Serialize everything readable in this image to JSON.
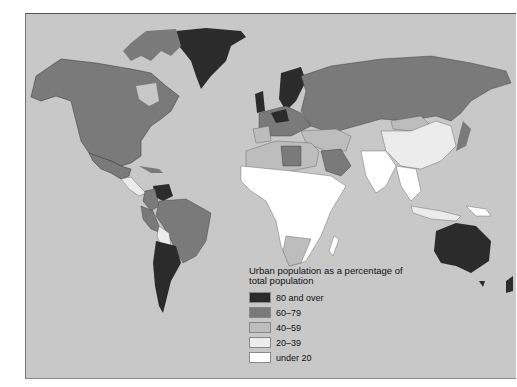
{
  "map": {
    "legend": {
      "title": "Urban population as a percentage of total population",
      "items": [
        {
          "label": "80 and over",
          "color": "#2b2b2b"
        },
        {
          "label": "60–79",
          "color": "#7a7a7a"
        },
        {
          "label": "40–59",
          "color": "#bdbdbd"
        },
        {
          "label": "20–39",
          "color": "#ececec"
        },
        {
          "label": "under 20",
          "color": "#ffffff"
        }
      ]
    },
    "colors": {
      "ocean": "#c8c8c8",
      "c80": "#2b2b2b",
      "c60": "#7a7a7a",
      "c40": "#bdbdbd",
      "c20": "#ececec",
      "c0": "#ffffff",
      "border": "#333333"
    }
  }
}
